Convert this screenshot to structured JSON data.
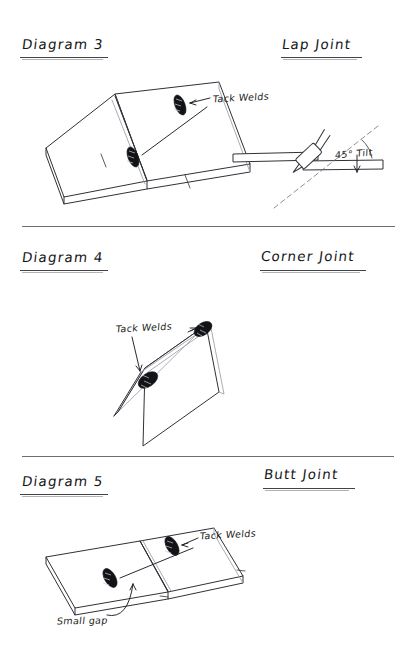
{
  "sheet": {
    "background": "#ffffff",
    "ink": "#2e3136",
    "width": 417,
    "height": 663
  },
  "sections": [
    {
      "id": "lap-joint",
      "diagram_label": "Diagram 3",
      "joint_label": "Lap Joint",
      "annotations": [
        {
          "id": "tack-welds",
          "text": "Tack Welds"
        },
        {
          "id": "tilt-angle",
          "text": "45° Tilt"
        }
      ]
    },
    {
      "id": "corner-joint",
      "diagram_label": "Diagram 4",
      "joint_label": "Corner Joint",
      "annotations": [
        {
          "id": "tack-welds",
          "text": "Tack Welds"
        }
      ]
    },
    {
      "id": "butt-joint",
      "diagram_label": "Diagram 5",
      "joint_label": "Butt Joint",
      "annotations": [
        {
          "id": "tack-welds",
          "text": "Tack Welds"
        },
        {
          "id": "small-gap",
          "text": "Small gap"
        }
      ]
    }
  ]
}
